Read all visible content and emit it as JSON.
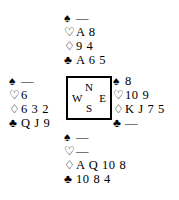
{
  "diagram": {
    "type": "bridge-deal-diagram",
    "void_symbol": "—",
    "suit_symbols": {
      "spade": "♠",
      "heart": "♡",
      "diamond": "♢",
      "club": "♣"
    },
    "compass": {
      "north": "N",
      "west": "W",
      "east": "E",
      "south": "S"
    },
    "hands": {
      "north": {
        "label": "North",
        "spades": "—",
        "hearts": "A 8",
        "diamonds": "9 4",
        "clubs": "A 6 5"
      },
      "west": {
        "label": "West",
        "spades": "—",
        "hearts": "6",
        "diamonds": "6 3 2",
        "clubs": "Q J 9"
      },
      "east": {
        "label": "East",
        "spades": "8",
        "hearts": "10 9",
        "diamonds": "K J 7 5",
        "clubs": "—"
      },
      "south": {
        "label": "South",
        "spades": "—",
        "hearts": "—",
        "diamonds": "A Q 10 8",
        "clubs": "10 8 4"
      }
    },
    "colors": {
      "ink": "#000000",
      "background": "#ffffff"
    }
  }
}
